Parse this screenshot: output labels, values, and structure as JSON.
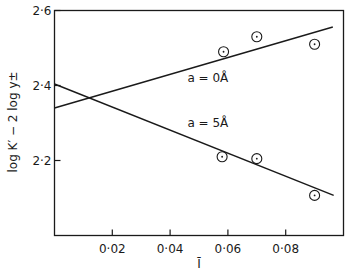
{
  "chart_data": {
    "type": "scatter",
    "title": "",
    "xlabel": "Ī",
    "ylabel": "log K′ − 2 log y±",
    "xlim": [
      0.0,
      0.1
    ],
    "ylim": [
      2.0,
      2.6
    ],
    "grid": false,
    "legend": null,
    "x_ticks": [
      0.02,
      0.04,
      0.06,
      0.08
    ],
    "x_tick_labels": [
      "0·02",
      "0·04",
      "0·06",
      "0·08"
    ],
    "y_ticks": [
      2.2,
      2.4,
      2.6
    ],
    "y_tick_labels": [
      "2·2",
      "2·4",
      "2·6"
    ],
    "series": [
      {
        "name": "a = 0Å",
        "marker": "circle-dot",
        "points": [
          {
            "x": 0.0585,
            "y": 2.49
          },
          {
            "x": 0.07,
            "y": 2.53
          },
          {
            "x": 0.09,
            "y": 2.51
          }
        ],
        "fit_line": {
          "x": [
            0.0,
            0.0963
          ],
          "y": [
            2.34,
            2.556
          ]
        }
      },
      {
        "name": "a = 5Å",
        "marker": "circle-dot",
        "points": [
          {
            "x": 0.058,
            "y": 2.21
          },
          {
            "x": 0.07,
            "y": 2.205
          },
          {
            "x": 0.09,
            "y": 2.107
          }
        ],
        "fit_line": {
          "x": [
            0.0,
            0.0966
          ],
          "y": [
            2.404,
            2.107
          ]
        }
      }
    ],
    "annotations": [
      {
        "text": "a = 0Å",
        "x": 0.046,
        "y": 2.41,
        "series": "a = 0Å"
      },
      {
        "text": "a = 5Å",
        "x": 0.046,
        "y": 2.29,
        "series": "a = 5Å"
      }
    ]
  }
}
